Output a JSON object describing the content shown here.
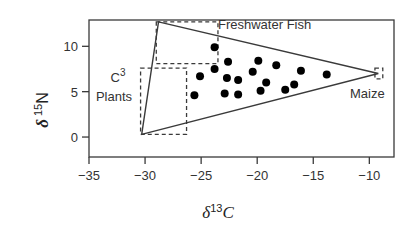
{
  "chart_data": {
    "type": "scatter",
    "title": "",
    "xlabel": "δ13C",
    "ylabel": "δ15N",
    "xlabel_parts": {
      "delta": "δ",
      "sup": "13",
      "element": "C"
    },
    "ylabel_parts": {
      "delta": "δ",
      "sup": "15",
      "element": "N"
    },
    "xlim": [
      -35,
      -7.8
    ],
    "ylim": [
      -2.2,
      12.9
    ],
    "x_ticks": [
      -35,
      -30,
      -25,
      -20,
      -15,
      -10
    ],
    "y_ticks": [
      0,
      5,
      10
    ],
    "grid": false,
    "legend": null,
    "series": [
      {
        "name": "samples",
        "marker": "filled-circle",
        "color": "#000000",
        "points": [
          {
            "x": -25.6,
            "y": 4.6
          },
          {
            "x": -25.1,
            "y": 6.7
          },
          {
            "x": -23.8,
            "y": 7.5
          },
          {
            "x": -23.8,
            "y": 9.9
          },
          {
            "x": -22.6,
            "y": 8.3
          },
          {
            "x": -22.7,
            "y": 6.5
          },
          {
            "x": -22.9,
            "y": 4.8
          },
          {
            "x": -21.7,
            "y": 6.3
          },
          {
            "x": -21.7,
            "y": 4.7
          },
          {
            "x": -20.4,
            "y": 7.2
          },
          {
            "x": -19.9,
            "y": 8.4
          },
          {
            "x": -19.7,
            "y": 5.1
          },
          {
            "x": -19.2,
            "y": 6.0
          },
          {
            "x": -18.3,
            "y": 7.9
          },
          {
            "x": -17.5,
            "y": 5.2
          },
          {
            "x": -16.7,
            "y": 5.8
          },
          {
            "x": -16.1,
            "y": 7.3
          },
          {
            "x": -13.8,
            "y": 6.9
          }
        ]
      }
    ],
    "mixing_triangle": {
      "vertices": [
        {
          "x": -28.8,
          "y": 12.7
        },
        {
          "x": -9.2,
          "y": 7.0
        },
        {
          "x": -30.3,
          "y": 0.3
        }
      ],
      "style": "solid"
    },
    "source_boxes": [
      {
        "name": "Freshwater Fish",
        "label": "Freshwater Fish",
        "x0": -29.0,
        "x1": -23.5,
        "y0": 8.1,
        "y1": 12.7,
        "style": "dashed"
      },
      {
        "name": "C3 Plants",
        "label_line1": "C",
        "label_sup": "3",
        "label_line2": "Plants",
        "x0": -30.4,
        "x1": -26.3,
        "y0": 0.3,
        "y1": 7.6,
        "style": "dashed"
      },
      {
        "name": "Maize",
        "label": "Maize",
        "x0": -9.5,
        "x1": -8.8,
        "y0": 6.4,
        "y1": 7.6,
        "style": "dashed"
      }
    ],
    "annotations": [
      "Freshwater Fish",
      "C3 Plants",
      "Maize"
    ]
  }
}
